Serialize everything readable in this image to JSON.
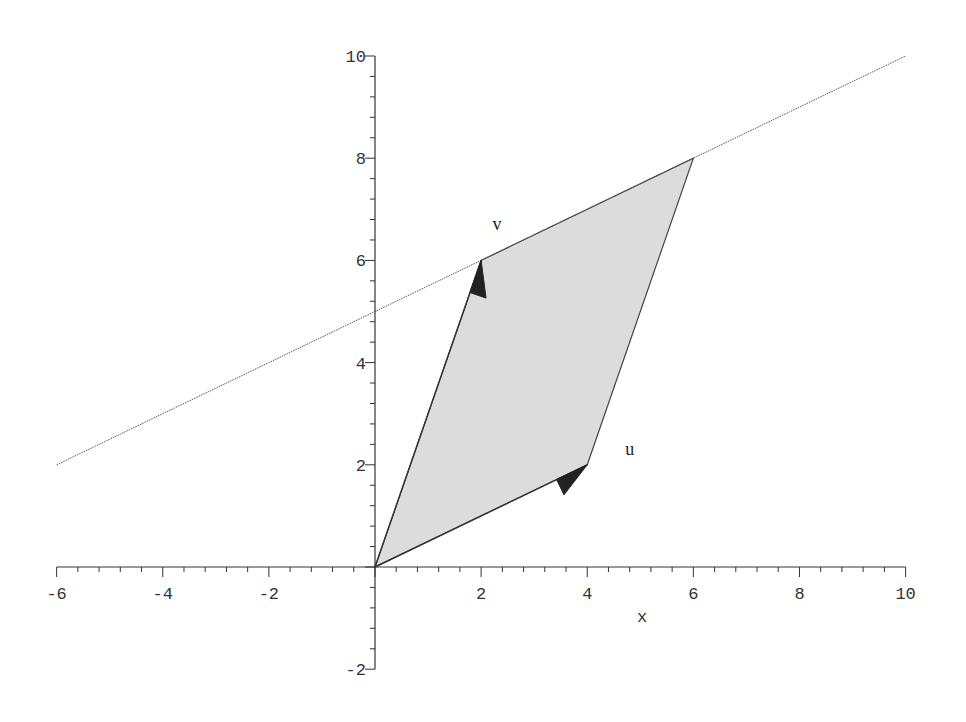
{
  "chart_data": {
    "type": "line",
    "title": "",
    "xlabel": "x",
    "ylabel": "",
    "xlim": [
      -6,
      10
    ],
    "ylim": [
      -2,
      10
    ],
    "grid": false,
    "x_ticks": [
      -6,
      -4,
      -2,
      2,
      4,
      6,
      8,
      10
    ],
    "y_ticks": [
      -2,
      2,
      4,
      6,
      8,
      10
    ],
    "series": [
      {
        "name": "line",
        "kind": "line",
        "style": "thin dotted",
        "equation": "y = x/2 + 5",
        "points": [
          [
            -6,
            2
          ],
          [
            10,
            10
          ]
        ]
      },
      {
        "name": "parallelogram",
        "kind": "polygon",
        "fill": "#dcdcdc",
        "points": [
          [
            0,
            0
          ],
          [
            4,
            2
          ],
          [
            6,
            8
          ],
          [
            2,
            6
          ]
        ]
      },
      {
        "name": "u",
        "kind": "vector",
        "from": [
          0,
          0
        ],
        "to": [
          4,
          2
        ]
      },
      {
        "name": "v",
        "kind": "vector",
        "from": [
          0,
          0
        ],
        "to": [
          2,
          6
        ]
      }
    ],
    "annotations": [
      {
        "text": "u",
        "at": [
          4.8,
          2.2
        ]
      },
      {
        "text": "v",
        "at": [
          2.3,
          6.6
        ]
      }
    ]
  },
  "colors": {
    "axis": "#333333",
    "fill": "#dcdcdc",
    "arrow": "#222222",
    "line": "#555555"
  }
}
